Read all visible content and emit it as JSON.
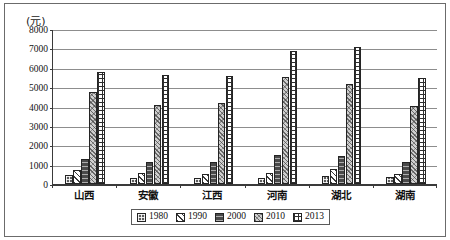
{
  "unit_label": "(元)",
  "legend": {
    "entries": [
      {
        "label": "1980",
        "key": "1980"
      },
      {
        "label": "1990",
        "key": "1990"
      },
      {
        "label": "2000",
        "key": "2000"
      },
      {
        "label": "2010",
        "key": "2010"
      },
      {
        "label": "2013",
        "key": "2013"
      }
    ]
  },
  "axis": {
    "y_ticks": [
      "0",
      "1000",
      "2000",
      "3000",
      "4000",
      "5000",
      "6000",
      "7000",
      "8000"
    ]
  },
  "chart_data": {
    "type": "bar",
    "title": "",
    "subtitle": "",
    "xlabel": "",
    "ylabel": "(元)",
    "ylim": [
      0,
      8000
    ],
    "ytick_step": 1000,
    "grid": true,
    "legend_position": "bottom",
    "categories": [
      "山西",
      "安徽",
      "江西",
      "河南",
      "湖北",
      "湖南"
    ],
    "series": [
      {
        "name": "1980",
        "values": [
          450,
          300,
          320,
          320,
          430,
          350
        ]
      },
      {
        "name": "1990",
        "values": [
          730,
          590,
          540,
          580,
          770,
          510
        ]
      },
      {
        "name": "2000",
        "values": [
          1310,
          1150,
          1150,
          1520,
          1460,
          1120
        ]
      },
      {
        "name": "2010",
        "values": [
          4750,
          4060,
          4160,
          5530,
          5160,
          4020
        ]
      },
      {
        "name": "2013",
        "values": [
          5790,
          5620,
          5600,
          6890,
          7050,
          5450
        ]
      }
    ]
  }
}
